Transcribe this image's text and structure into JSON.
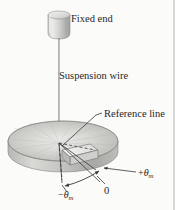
{
  "figure": {
    "background_color": "#fbfbfa",
    "ink_color": "#27272a",
    "labels": {
      "fixed_end": "Fixed end",
      "suspension_wire": "Suspension wire",
      "reference_line": "Reference line",
      "zero": "0",
      "plus_theta_sign": "+",
      "plus_theta_symbol": "θ",
      "plus_theta_subscript": "m",
      "minus_theta_sign": "−",
      "minus_theta_symbol": "θ",
      "minus_theta_subscript": "m"
    },
    "parts": {
      "support_cylinder": "support-cylinder",
      "wire": "suspension-wire",
      "disk": "rotating-disk",
      "reference_tab": "reference-line-tab",
      "angle_arc": "angular-displacement-arc"
    },
    "colors": {
      "disk_light": "#f0f0ee",
      "disk_mid": "#c9c9c6",
      "disk_dark": "#9a9a97",
      "disk_edge": "#8c8c89",
      "cylinder_light": "#ececeb",
      "cylinder_dark": "#b4b4b1",
      "line": "#4a4a4c"
    }
  }
}
